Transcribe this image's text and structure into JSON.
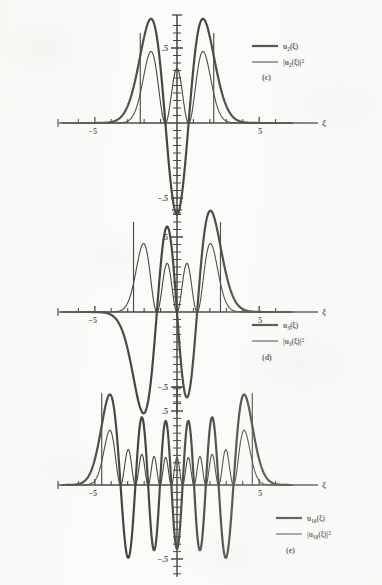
{
  "figure": {
    "kind": "quantum-harmonic-oscillator-eigenfunctions",
    "background_color": "#fbfbfa",
    "ink_color": "#17150f",
    "panels": [
      {
        "id": "c",
        "panel_label": "(c)",
        "n": 2,
        "legend": [
          {
            "label_main": "u",
            "label_sub": "2",
            "label_arg": "(ξ)",
            "label_sup": "",
            "bracket": false,
            "stroke_width": 2.2,
            "name": "u2-wavefunction"
          },
          {
            "label_main": "|u",
            "label_sub": "2",
            "label_arg": "(ξ)|",
            "label_sup": "2",
            "bracket": true,
            "stroke_width": 1.1,
            "name": "u2-probability-density"
          }
        ],
        "xlabel": "ξ",
        "xticklabels": [
          "−5",
          "5"
        ],
        "yticklabels": [
          ".5",
          "−.5"
        ],
        "xlim": [
          -7.0,
          7.0
        ],
        "ylim": [
          -0.62,
          0.72
        ],
        "turning_points": [
          -2.236,
          2.236
        ],
        "ytick_major": [
          0.5,
          -0.5
        ],
        "xtick_major": [
          -5,
          5
        ],
        "chart_type": "line"
      },
      {
        "id": "d",
        "panel_label": "(d)",
        "n": 3,
        "legend": [
          {
            "label_main": "u",
            "label_sub": "3",
            "label_arg": "(ξ)",
            "label_sup": "",
            "bracket": false,
            "stroke_width": 2.2,
            "name": "u3-wavefunction"
          },
          {
            "label_main": "|u",
            "label_sub": "3",
            "label_arg": "(ξ)|",
            "label_sup": "2",
            "bracket": true,
            "stroke_width": 1.1,
            "name": "u3-probability-density"
          }
        ],
        "xlabel": "ξ",
        "xticklabels": [
          "−5",
          "5"
        ],
        "yticklabels": [
          ".5",
          "−.5"
        ],
        "xlim": [
          -7.0,
          7.0
        ],
        "ylim": [
          -0.68,
          0.68
        ],
        "turning_points": [
          -2.646,
          2.646
        ],
        "ytick_major": [
          0.5,
          -0.5
        ],
        "xtick_major": [
          -5,
          5
        ],
        "chart_type": "line"
      },
      {
        "id": "e",
        "panel_label": "(e)",
        "n": 10,
        "legend": [
          {
            "label_main": "u",
            "label_sub": "10",
            "label_arg": "(ξ)",
            "label_sup": "",
            "bracket": false,
            "stroke_width": 2.2,
            "name": "u10-wavefunction"
          },
          {
            "label_main": "|u",
            "label_sub": "10",
            "label_arg": "(ξ)|",
            "label_sup": "2",
            "bracket": true,
            "stroke_width": 1.1,
            "name": "u10-probability-density"
          }
        ],
        "xlabel": "ξ",
        "xticklabels": [
          "−5",
          "5"
        ],
        "yticklabels": [
          ".5",
          "−.5"
        ],
        "xlim": [
          -7.0,
          7.0
        ],
        "ylim": [
          -0.62,
          0.66
        ],
        "turning_points": [
          -4.583,
          4.583
        ],
        "ytick_major": [
          0.5,
          -0.5
        ],
        "xtick_major": [
          -5,
          5
        ],
        "chart_type": "line"
      }
    ]
  },
  "chart_data": {
    "type": "line",
    "title": "",
    "xlabel": "ξ",
    "ylabel": "",
    "grid": false,
    "legend_position": "right",
    "panels": [
      {
        "name": "(c)",
        "quantum_number": 2,
        "xlim": [
          -7.0,
          7.0
        ],
        "ylim": [
          -0.62,
          0.72
        ],
        "xticks": [
          -5,
          5
        ],
        "xticklabels": [
          "−5",
          "5"
        ],
        "yticks": [
          0.5,
          -0.5
        ],
        "yticklabels": [
          ".5",
          "−.5"
        ],
        "turning_points": [
          -2.236,
          2.236
        ],
        "series": [
          {
            "name": "u_2(ξ)",
            "style": "thick",
            "nodes": [
              -0.7071,
              0.7071
            ],
            "extrema": [
              {
                "x": -1.9,
                "y": 0.62
              },
              {
                "x": 0.0,
                "y": -0.56
              },
              {
                "x": 1.9,
                "y": 0.62
              }
            ]
          },
          {
            "name": "|u_2(ξ)|^2",
            "style": "thin",
            "nodes": [
              -0.7071,
              0.7071
            ],
            "extrema": [
              {
                "x": -1.9,
                "y": 0.38
              },
              {
                "x": 0.0,
                "y": 0.31
              },
              {
                "x": 1.9,
                "y": 0.38
              }
            ]
          }
        ]
      },
      {
        "name": "(d)",
        "quantum_number": 3,
        "xlim": [
          -7.0,
          7.0
        ],
        "ylim": [
          -0.68,
          0.68
        ],
        "xticks": [
          -5,
          5
        ],
        "xticklabels": [
          "−5",
          "5"
        ],
        "yticks": [
          0.5,
          -0.5
        ],
        "yticklabels": [
          ".5",
          "−.5"
        ],
        "turning_points": [
          -2.646,
          2.646
        ],
        "series": [
          {
            "name": "u_3(ξ)",
            "style": "thick",
            "nodes": [
              -1.2247,
              0.0,
              1.2247
            ],
            "extrema": [
              {
                "x": -2.34,
                "y": -0.6
              },
              {
                "x": -0.61,
                "y": 0.56
              },
              {
                "x": 0.61,
                "y": -0.56
              },
              {
                "x": 2.34,
                "y": 0.6
              }
            ]
          },
          {
            "name": "|u_3(ξ)|^2",
            "style": "thin",
            "nodes": [
              -1.2247,
              0.0,
              1.2247
            ],
            "extrema": [
              {
                "x": -2.34,
                "y": 0.36
              },
              {
                "x": -0.61,
                "y": 0.31
              },
              {
                "x": 0.61,
                "y": 0.31
              },
              {
                "x": 2.34,
                "y": 0.36
              }
            ]
          }
        ]
      },
      {
        "name": "(e)",
        "quantum_number": 10,
        "xlim": [
          -7.0,
          7.0
        ],
        "ylim": [
          -0.62,
          0.66
        ],
        "xticks": [
          -5,
          5
        ],
        "xticklabels": [
          "−5",
          "5"
        ],
        "yticks": [
          0.5,
          -0.5
        ],
        "yticklabels": [
          ".5",
          "−.5"
        ],
        "turning_points": [
          -4.583,
          4.583
        ],
        "series": [
          {
            "name": "u_10(ξ)",
            "style": "thick",
            "node_count": 10,
            "envelope_peak": 0.56,
            "central_amplitude": 0.33
          },
          {
            "name": "|u_10(ξ)|^2",
            "style": "thin",
            "node_count": 10,
            "envelope_peak": 0.31,
            "central_amplitude": 0.11
          }
        ]
      }
    ]
  }
}
